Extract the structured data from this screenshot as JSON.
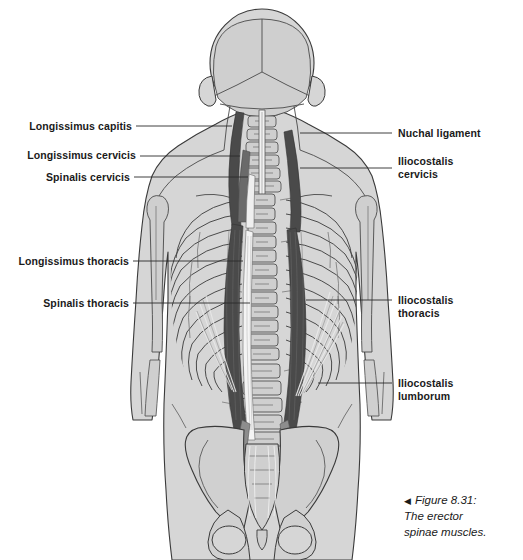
{
  "figure": {
    "caption_marker": "◀",
    "caption_text": "Figure 8.31:\nThe erector\nspinae muscles.",
    "background_color": "#ffffff",
    "body_fill": "#d6d6d6",
    "bone_fill": "#cfcfcf",
    "muscle_dark": "#4a4a4a",
    "muscle_mid": "#8d8d8d",
    "outline_color": "#3a3a3a",
    "leader_color": "#2b2b2b",
    "text_color": "#1a1a1a"
  },
  "labels_left": [
    {
      "text": "Longissimus capitis",
      "x": 30,
      "y": 120,
      "leader_x1": 136,
      "leader_x2": 232,
      "leader_y": 126
    },
    {
      "text": "Longissimus cervicis",
      "x": 30,
      "y": 149,
      "leader_x1": 140,
      "leader_x2": 240,
      "leader_y": 156
    },
    {
      "text": "Spinalis cervicis",
      "x": 43,
      "y": 171,
      "leader_x1": 134,
      "leader_x2": 248,
      "leader_y": 177
    },
    {
      "text": "Longissimus thoracis",
      "x": 25,
      "y": 255,
      "leader_x1": 133,
      "leader_x2": 243,
      "leader_y": 261
    },
    {
      "text": "Spinalis thoracis",
      "x": 46,
      "y": 297,
      "leader_x1": 133,
      "leader_x2": 250,
      "leader_y": 303
    }
  ],
  "labels_right": [
    {
      "text": "Nuchal ligament",
      "x": 398,
      "y": 127,
      "leader_x1": 300,
      "leader_x2": 392,
      "leader_y": 133
    },
    {
      "text": "Iliocostalis\ncervicis",
      "x": 398,
      "y": 155,
      "leader_x1": 300,
      "leader_x2": 392,
      "leader_y": 168
    },
    {
      "text": "Iliocostalis\nthoracis",
      "x": 398,
      "y": 294,
      "leader_x1": 306,
      "leader_x2": 392,
      "leader_y": 300
    },
    {
      "text": "Iliocostalis\nlumborum",
      "x": 398,
      "y": 377,
      "leader_x1": 318,
      "leader_x2": 392,
      "leader_y": 383
    }
  ]
}
